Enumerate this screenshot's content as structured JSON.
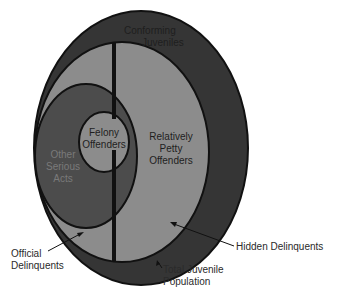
{
  "diagram": {
    "type": "nested-venn",
    "colors": {
      "total_population": "#353535",
      "delinquents": "#8c8c8c",
      "official_delinquents": "#4c4c4c",
      "felony_offenders": "#8c8c8c",
      "outline": "#111111",
      "background": "#ffffff"
    },
    "regions": {
      "conforming": [
        "Conforming",
        "Juveniles"
      ],
      "felony": [
        "Felony",
        "Offenders"
      ],
      "petty": [
        "Relatively",
        "Petty",
        "Offenders"
      ],
      "other_serious": [
        "Other",
        "Serious",
        "Acts"
      ]
    },
    "callouts": {
      "official": [
        "Official",
        "Delinquents"
      ],
      "hidden": [
        "Hidden Delinquents"
      ],
      "total": [
        "Total Juvenile",
        "Population"
      ]
    }
  }
}
